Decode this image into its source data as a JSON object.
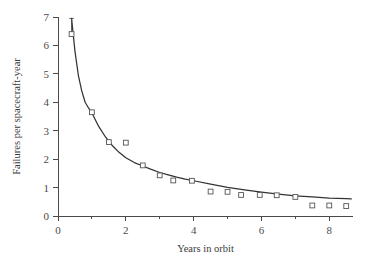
{
  "chart_data": {
    "type": "scatter",
    "title": "",
    "subtitle": "",
    "xlabel": "Years in orbit",
    "ylabel": "Failures per spacecraft-year",
    "xlim": [
      0,
      8.7
    ],
    "ylim": [
      0,
      7
    ],
    "grid": false,
    "legend": null,
    "x_ticks": [
      0,
      2,
      4,
      6,
      8
    ],
    "x_tick_labels": [
      "0",
      "2",
      "4",
      "6",
      "8"
    ],
    "x_minor_ticks": [
      1,
      3,
      5,
      7
    ],
    "y_ticks": [
      0,
      1,
      2,
      3,
      4,
      5,
      6,
      7
    ],
    "y_tick_labels": [
      "0",
      "1",
      "2",
      "3",
      "4",
      "5",
      "6",
      "7"
    ],
    "y_minor_ticks": [],
    "marker_style": "open-square",
    "series": [
      {
        "name": "Observed failure rate",
        "type": "scatter",
        "x": [
          0.4,
          1.0,
          1.5,
          2.0,
          2.5,
          3.0,
          3.4,
          3.95,
          4.5,
          5.0,
          5.4,
          5.95,
          6.45,
          7.0,
          7.5,
          8.0,
          8.5
        ],
        "y": [
          6.4,
          3.65,
          2.6,
          2.58,
          1.78,
          1.43,
          1.25,
          1.24,
          0.86,
          0.85,
          0.74,
          0.74,
          0.73,
          0.67,
          0.37,
          0.37,
          0.35
        ],
        "errorbars": [
          {
            "x": 0.4,
            "y": 6.4,
            "ymin": 6.4,
            "ymax": 6.95
          }
        ]
      },
      {
        "name": "Fitted decay curve",
        "type": "line",
        "x": [
          0.4,
          0.5,
          0.6,
          0.7,
          0.8,
          0.9,
          1.0,
          1.2,
          1.4,
          1.6,
          1.8,
          2.0,
          2.25,
          2.5,
          2.75,
          3.0,
          3.25,
          3.5,
          3.75,
          4.0,
          4.5,
          5.0,
          5.5,
          6.0,
          6.5,
          7.0,
          7.5,
          8.0,
          8.5,
          8.65
        ],
        "y": [
          6.95,
          5.8,
          4.95,
          4.4,
          4.0,
          3.8,
          3.62,
          3.15,
          2.78,
          2.48,
          2.24,
          2.05,
          1.88,
          1.76,
          1.64,
          1.53,
          1.45,
          1.37,
          1.3,
          1.24,
          1.12,
          1.01,
          0.92,
          0.84,
          0.77,
          0.71,
          0.67,
          0.63,
          0.61,
          0.6
        ]
      }
    ]
  },
  "axes": {
    "x_axis_label": "Years in orbit",
    "y_axis_label": "Failures per spacecraft-year"
  },
  "colors": {
    "curve": "#333333",
    "marker_stroke": "#555555",
    "marker_fill": "#ffffff",
    "axis": "#4a4a4a",
    "text": "#3a3a3a",
    "background": "#ffffff"
  }
}
